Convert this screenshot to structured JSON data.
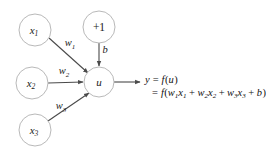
{
  "diagram": {
    "background_color": "#ffffff",
    "node_stroke_color": "#b9b9b9",
    "edge_color": "#4a4a4a",
    "text_color": "#1a1a1a",
    "nodes": [
      {
        "id": "x1",
        "label": "x",
        "subscript": "1",
        "style": "italic",
        "cx": 35,
        "cy": 30,
        "r": 16
      },
      {
        "id": "bias",
        "label": "+1",
        "subscript": "",
        "style": "plain",
        "cx": 99,
        "cy": 27,
        "r": 16
      },
      {
        "id": "x2",
        "label": "x",
        "subscript": "2",
        "style": "italic",
        "cx": 32,
        "cy": 83,
        "r": 16
      },
      {
        "id": "x3",
        "label": "x",
        "subscript": "3",
        "style": "italic",
        "cx": 35,
        "cy": 130,
        "r": 16
      },
      {
        "id": "u",
        "label": "u",
        "subscript": "",
        "style": "italic",
        "cx": 99,
        "cy": 82,
        "r": 15
      }
    ],
    "edges": [
      {
        "id": "edge-x1-u",
        "from": "x1",
        "to": "u",
        "label": "w",
        "subscript": "1",
        "label_x": 70,
        "label_y": 44
      },
      {
        "id": "edge-bias-u",
        "from": "bias",
        "to": "u",
        "label": "b",
        "subscript": "",
        "label_x": 105,
        "label_y": 51
      },
      {
        "id": "edge-x2-u",
        "from": "x2",
        "to": "u",
        "label": "w",
        "subscript": "2",
        "label_x": 64,
        "label_y": 72
      },
      {
        "id": "edge-x3-u",
        "from": "x3",
        "to": "u",
        "label": "w",
        "subscript": "3",
        "label_x": 61,
        "label_y": 107
      },
      {
        "id": "edge-u-output",
        "from": "u",
        "to": "output",
        "label": "",
        "subscript": "",
        "label_x": 0,
        "label_y": 0
      }
    ],
    "output": {
      "line1": {
        "y": "y",
        "eq": "=",
        "f": "f",
        "open": "(",
        "u": "u",
        "close": ")"
      },
      "line2": {
        "eq": "=",
        "f": "f",
        "open": "(",
        "terms": [
          {
            "w": "w",
            "wsub": "1",
            "x": "x",
            "xsub": "1"
          },
          {
            "w": "w",
            "wsub": "2",
            "x": "x",
            "xsub": "2"
          },
          {
            "w": "w",
            "wsub": "3",
            "x": "x",
            "xsub": "3"
          }
        ],
        "plus": "+",
        "bias": "b",
        "close": ")"
      }
    }
  }
}
